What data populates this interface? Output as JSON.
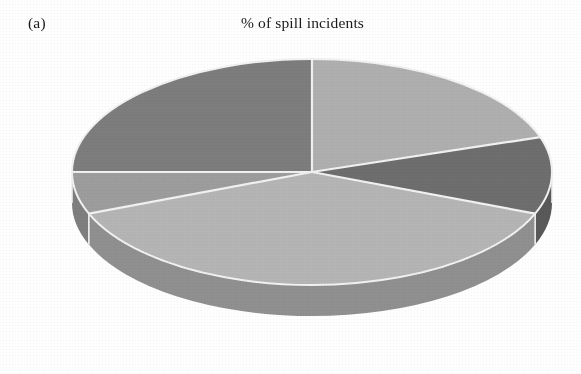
{
  "figure": {
    "panel_label": "(a)",
    "title": "% of spill incidents"
  },
  "chart_data": {
    "type": "pie",
    "title": "% of spill incidents",
    "panel": "(a)",
    "xlabel": "",
    "ylabel": "",
    "unit": "%",
    "three_d": true,
    "start_angle_deg": 0,
    "direction": "clockwise",
    "legend": "none",
    "grid": false,
    "data_labels_shown": false,
    "categories": [
      "Slice 1",
      "Slice 2",
      "Slice 3",
      "Slice 4",
      "Slice 5"
    ],
    "values": [
      20,
      11,
      38,
      6,
      25
    ],
    "colors": [
      "#afafaf",
      "#6e6e6e",
      "#b5b5b5",
      "#9d9d9d",
      "#7d7d7d"
    ],
    "side_colors": [
      "#8e8e8e",
      "#595959",
      "#909090",
      "#7f7f7f",
      "#656565"
    ],
    "slices": [
      {
        "name": "Slice 1",
        "value": 20,
        "color": "#afafaf",
        "start_deg": 0,
        "end_deg": 72
      },
      {
        "name": "Slice 2",
        "value": 11,
        "color": "#6e6e6e",
        "start_deg": 72,
        "end_deg": 111.6
      },
      {
        "name": "Slice 3",
        "value": 38,
        "color": "#b5b5b5",
        "start_deg": 111.6,
        "end_deg": 248.4
      },
      {
        "name": "Slice 4",
        "value": 6,
        "color": "#9d9d9d",
        "start_deg": 248.4,
        "end_deg": 270
      },
      {
        "name": "Slice 5",
        "value": 25,
        "color": "#7d7d7d",
        "start_deg": 270,
        "end_deg": 360
      }
    ],
    "separator_color": "#f2f2f2",
    "background_color": "#ffffff"
  },
  "geometry": {
    "center_x": 312,
    "center_y": 172,
    "radius_x": 240,
    "radius_y": 113,
    "depth": 31
  }
}
